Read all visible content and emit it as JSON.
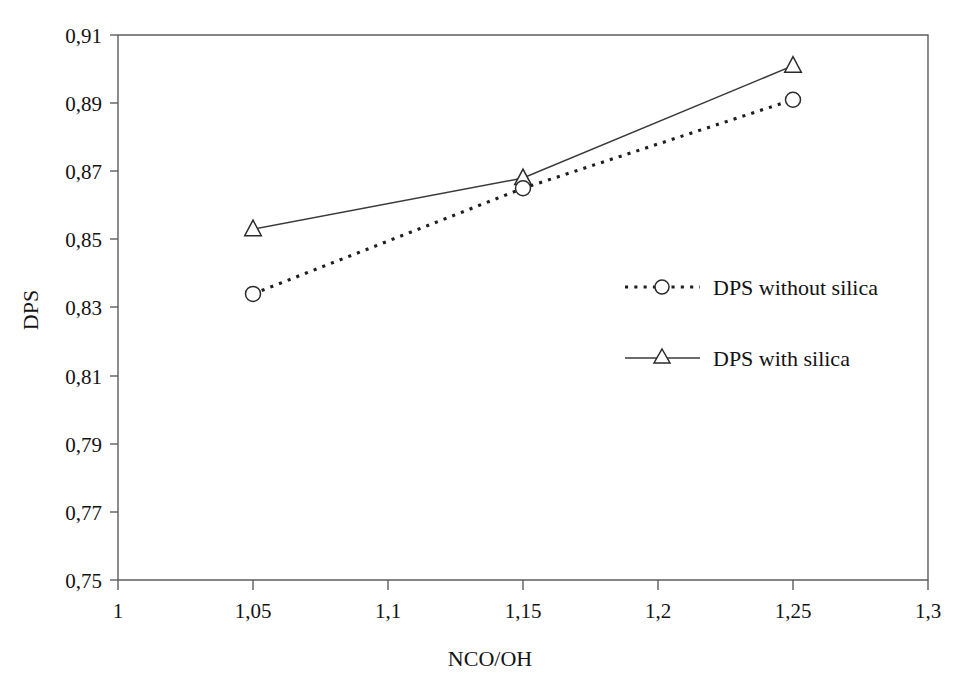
{
  "chart_data": {
    "type": "line",
    "title": "",
    "xlabel": "NCO/OH",
    "ylabel": "DPS",
    "xlim": [
      1,
      1.3
    ],
    "ylim": [
      0.75,
      0.91
    ],
    "grid": false,
    "legend_position": "center-right inside plot area",
    "x": [
      1.05,
      1.15,
      1.25
    ],
    "xtick_labels": [
      "1",
      "1,05",
      "1,1",
      "1,15",
      "1,2",
      "1,25",
      "1,3"
    ],
    "xtick_values": [
      1,
      1.05,
      1.1,
      1.15,
      1.2,
      1.25,
      1.3
    ],
    "ytick_labels": [
      "0,75",
      "0,77",
      "0,79",
      "0,81",
      "0,83",
      "0,85",
      "0,87",
      "0,89",
      "0,91"
    ],
    "ytick_values": [
      0.75,
      0.77,
      0.79,
      0.81,
      0.83,
      0.85,
      0.87,
      0.89,
      0.91
    ],
    "series": [
      {
        "name": "DPS without silica",
        "marker": "open-circle",
        "line_style": "dotted",
        "values": [
          0.834,
          0.865,
          0.891
        ]
      },
      {
        "name": "DPS with silica",
        "marker": "open-triangle",
        "line_style": "solid",
        "values": [
          0.853,
          0.868,
          0.901
        ]
      }
    ]
  },
  "legend": {
    "entries": [
      {
        "label": "DPS without silica",
        "marker": "open-circle-icon",
        "line_style": "dotted"
      },
      {
        "label": "DPS with silica",
        "marker": "open-triangle-icon",
        "line_style": "solid"
      }
    ]
  },
  "colors": {
    "background": "#ffffff",
    "axis": "#5d5d5d",
    "text": "#131313",
    "series_without_silica": "#1e1e1e",
    "series_with_silica": "#3a3a3a"
  }
}
